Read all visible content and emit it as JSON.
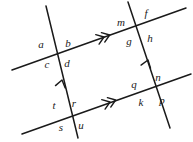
{
  "figure": {
    "width": 193,
    "height": 142,
    "background_color": "#ffffff",
    "stroke_color": "#1a1a1a"
  },
  "lines": [
    {
      "name": "upper-transversal",
      "kind": "transversal",
      "arrow_marks": 2,
      "arrow_direction": "right",
      "x1": 12,
      "y1": 70,
      "x2": 186,
      "y2": 8
    },
    {
      "name": "lower-transversal",
      "kind": "transversal",
      "arrow_marks": 2,
      "arrow_direction": "right",
      "x1": 22,
      "y1": 134,
      "x2": 191,
      "y2": 74
    },
    {
      "name": "left-slant",
      "kind": "slant",
      "arrow_marks": 1,
      "arrow_direction": "up",
      "x1": 78,
      "y1": 138,
      "x2": 46,
      "y2": 6
    },
    {
      "name": "right-slant",
      "kind": "slant",
      "arrow_marks": 1,
      "arrow_direction": "up",
      "x1": 170,
      "y1": 128,
      "x2": 128,
      "y2": 2
    }
  ],
  "intersections": [
    {
      "name": "top-left",
      "x": 57,
      "y": 52,
      "angles": [
        {
          "label": "a",
          "position": "upper-left",
          "x": 41,
          "y": 44
        },
        {
          "label": "b",
          "position": "upper-right",
          "x": 68,
          "y": 43
        },
        {
          "label": "c",
          "position": "lower-left",
          "x": 47,
          "y": 64
        },
        {
          "label": "d",
          "position": "lower-right",
          "x": 67,
          "y": 63
        }
      ]
    },
    {
      "name": "top-right",
      "x": 138,
      "y": 23,
      "angles": [
        {
          "label": "m",
          "position": "upper-left",
          "x": 121,
          "y": 22
        },
        {
          "label": "f",
          "position": "upper-right",
          "x": 146,
          "y": 13
        },
        {
          "label": "g",
          "position": "lower-left",
          "x": 129,
          "y": 41
        },
        {
          "label": "h",
          "position": "lower-right",
          "x": 150,
          "y": 38
        }
      ]
    },
    {
      "name": "bottom-left",
      "x": 69,
      "y": 116,
      "angles": [
        {
          "label": "t",
          "position": "upper-left",
          "x": 54,
          "y": 105
        },
        {
          "label": "r",
          "position": "upper-right",
          "x": 74,
          "y": 103
        },
        {
          "label": "s",
          "position": "lower-left",
          "x": 61,
          "y": 127
        },
        {
          "label": "u",
          "position": "lower-right",
          "x": 81,
          "y": 125
        }
      ]
    },
    {
      "name": "bottom-right",
      "x": 150,
      "y": 88,
      "angles": [
        {
          "label": "q",
          "position": "upper-left",
          "x": 134,
          "y": 84
        },
        {
          "label": "n",
          "position": "upper-right",
          "x": 158,
          "y": 77
        },
        {
          "label": "k",
          "position": "lower-left",
          "x": 141,
          "y": 102
        },
        {
          "label": "p",
          "position": "lower-right",
          "x": 162,
          "y": 100
        }
      ]
    }
  ],
  "arrow_markers": [
    {
      "name": "upper-transversal-double-arrow",
      "x": 104,
      "y": 37,
      "angle": -19.6,
      "count": 2
    },
    {
      "name": "lower-transversal-double-arrow",
      "x": 110,
      "y": 102,
      "angle": -19.6,
      "count": 2
    },
    {
      "name": "left-slant-single-arrow",
      "x": 62,
      "y": 80,
      "angle": -76.3,
      "count": 1
    },
    {
      "name": "right-slant-single-arrow",
      "x": 148,
      "y": 60,
      "angle": -71.6,
      "count": 1
    }
  ]
}
